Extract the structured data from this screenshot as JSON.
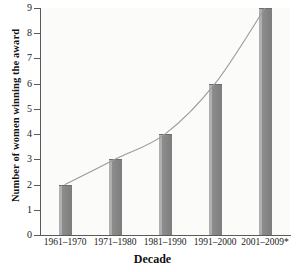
{
  "chart_data": {
    "type": "bar",
    "title": "",
    "xlabel": "Decade",
    "ylabel": "Number of women winning the award",
    "categories": [
      "1961–1970",
      "1971–1980",
      "1981–1990",
      "1991–2000",
      "2001–2009*"
    ],
    "values": [
      2,
      3,
      4,
      6,
      9
    ],
    "ylim": [
      0,
      9
    ],
    "yticks": [
      "0",
      "1",
      "2",
      "3",
      "4",
      "5",
      "6",
      "7",
      "8",
      "9"
    ],
    "grid": false,
    "legend": null,
    "overlay": {
      "type": "line",
      "name": "trend curve",
      "values": [
        2,
        3,
        4,
        6,
        9
      ],
      "smooth": true
    },
    "colors": {
      "bar_fill": "#7d7d7d",
      "bar_highlight": "#b0b0b0",
      "bar_edge": "#6f6f6f",
      "line": "#9a9a9a",
      "axis": "#5a5a5a",
      "plot_background": "#fbfbfa",
      "text": "#1a1a1a"
    },
    "annotations": [
      "* decade 2001–2009 is partial, marked with asterisk"
    ]
  }
}
